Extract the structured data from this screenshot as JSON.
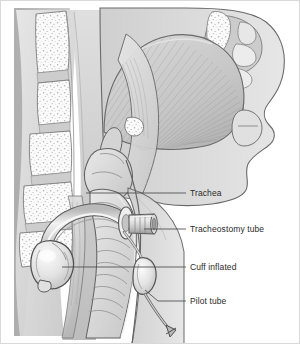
{
  "figure": {
    "type": "medical-illustration",
    "style": "grayscale line drawing",
    "background_color": "#ffffff",
    "frame_color": "#d9d9d9",
    "width": 300,
    "height": 344
  },
  "palette": {
    "outline": "#5a5a5a",
    "outline_dark": "#3d3d3d",
    "tissue_light": "#e4e4e4",
    "tissue_mid": "#cfcfcf",
    "tissue_dark": "#b4b4b4",
    "tissue_deep": "#9c9c9c",
    "bone_white": "#fbfbfb",
    "bone_speckle": "#b9b9b9",
    "tube_fill": "#d2d2d2",
    "tube_highlight": "#f4f4f4",
    "cuff_fill": "#e8e8e8",
    "leader_line": "#4a4a4a",
    "label_text": "#2b2b2b"
  },
  "labels": [
    {
      "id": "trachea",
      "text": "Trachea",
      "text_x": 190,
      "text_y": 196,
      "leader": {
        "x1": 86,
        "y1": 193,
        "x2": 186,
        "y2": 193
      }
    },
    {
      "id": "tracheostomy-tube",
      "text": "Tracheostomy tube",
      "text_x": 190,
      "text_y": 232,
      "leader": {
        "x1": 144,
        "y1": 229,
        "x2": 186,
        "y2": 229
      }
    },
    {
      "id": "cuff-inflated",
      "text": "Cuff inflated",
      "text_x": 190,
      "text_y": 270,
      "leader": {
        "x1": 62,
        "y1": 267,
        "x2": 186,
        "y2": 267
      }
    },
    {
      "id": "pilot-tube",
      "text": "Pilot tube",
      "text_x": 190,
      "text_y": 304,
      "leader": {
        "x1": 145,
        "y1": 290,
        "x2": 186,
        "y2": 301
      }
    }
  ],
  "anatomy": {
    "vertebrae_count": 5,
    "structures": [
      "cervical vertebrae",
      "intervertebral discs",
      "spinal soft tissue",
      "tongue",
      "hard palate",
      "soft palate",
      "nasal cavity",
      "nasal turbinates",
      "nasopharynx",
      "oropharynx",
      "epiglottis",
      "hyoid bone",
      "larynx",
      "trachea",
      "esophagus",
      "facial profile",
      "lips",
      "chin / mandible",
      "neck skin"
    ]
  },
  "device": {
    "name": "cuffed tracheostomy tube",
    "parts": [
      "curved cannula",
      "neck flange plate",
      "15 mm connector hub",
      "inflated cuff",
      "pilot tube",
      "pilot balloon",
      "one-way inflation valve"
    ]
  }
}
